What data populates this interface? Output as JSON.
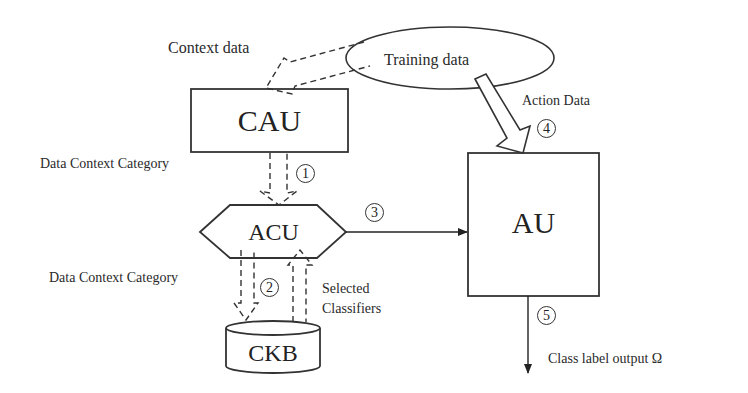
{
  "diagram": {
    "nodes": {
      "cau": {
        "label": "CAU"
      },
      "acu": {
        "label": "ACU"
      },
      "au": {
        "label": "AU"
      },
      "ckb": {
        "label": "CKB"
      },
      "training": {
        "label": "Training  data"
      }
    },
    "labels": {
      "context_data": "Context data",
      "data_context_category_1": "Data Context Category",
      "data_context_category_2": "Data Context Category",
      "action_data": "Action Data",
      "selected_classifiers_line1": "Selected",
      "selected_classifiers_line2": "Classifiers",
      "class_label_output": "Class label output Ω"
    },
    "steps": {
      "s1": "1",
      "s2": "2",
      "s3": "3",
      "s4": "4",
      "s5": "5"
    },
    "edges": [
      {
        "from": "Training data",
        "to": "CAU",
        "style": "dashed",
        "label": "Context data"
      },
      {
        "from": "CAU",
        "to": "ACU",
        "style": "dashed",
        "label": "Data Context Category",
        "step": "1"
      },
      {
        "from": "ACU",
        "to": "CKB",
        "style": "dashed",
        "label": "Data Context Category",
        "step": "2"
      },
      {
        "from": "CKB",
        "to": "ACU",
        "style": "dashed",
        "label": "Selected Classifiers"
      },
      {
        "from": "ACU",
        "to": "AU",
        "style": "solid",
        "step": "3"
      },
      {
        "from": "Training data",
        "to": "AU",
        "style": "hollow",
        "label": "Action Data",
        "step": "4"
      },
      {
        "from": "AU",
        "to": "output",
        "style": "solid",
        "label": "Class label output Ω",
        "step": "5"
      }
    ]
  }
}
